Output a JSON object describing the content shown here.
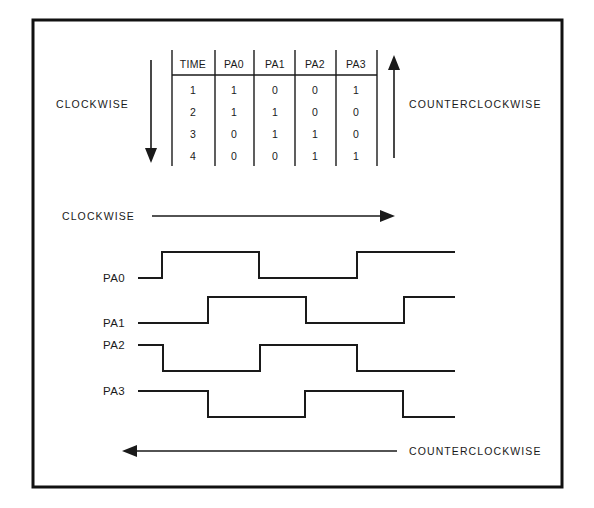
{
  "figure": {
    "border_color": "#111111",
    "line_color": "#1a1a1a",
    "background": "#ffffff"
  },
  "table": {
    "columns": [
      "TIME",
      "PA0",
      "PA1",
      "PA2",
      "PA3"
    ],
    "rows": [
      [
        "1",
        "1",
        "0",
        "0",
        "1"
      ],
      [
        "2",
        "1",
        "1",
        "0",
        "0"
      ],
      [
        "3",
        "0",
        "1",
        "1",
        "0"
      ],
      [
        "4",
        "0",
        "0",
        "1",
        "1"
      ]
    ]
  },
  "direction_labels": {
    "table_clockwise": "CLOCKWISE",
    "table_counterclockwise": "COUNTERCLOCKWISE",
    "wave_clockwise": "CLOCKWISE",
    "wave_counterclockwise": "COUNTERCLOCKWISE"
  },
  "arrows": {
    "table_clockwise_direction": "down",
    "table_counterclockwise_direction": "up",
    "wave_clockwise_direction": "right",
    "wave_counterclockwise_direction": "left"
  },
  "waveforms": {
    "signals": [
      {
        "name": "PA0",
        "label_level": "low",
        "start_level": 0,
        "transitions": [
          162,
          259,
          357
        ],
        "levels": [
          0,
          1,
          0,
          1
        ]
      },
      {
        "name": "PA1",
        "label_level": "low",
        "start_level": 0,
        "transitions": [
          208,
          306,
          404
        ],
        "levels": [
          0,
          1,
          0,
          1
        ]
      },
      {
        "name": "PA2",
        "label_level": "high",
        "start_level": 1,
        "transitions": [
          163,
          260,
          357
        ],
        "levels": [
          1,
          0,
          1,
          0
        ]
      },
      {
        "name": "PA3",
        "label_level": "high",
        "start_level": 1,
        "transitions": [
          208,
          305,
          403
        ],
        "levels": [
          1,
          0,
          1,
          0
        ]
      }
    ]
  }
}
